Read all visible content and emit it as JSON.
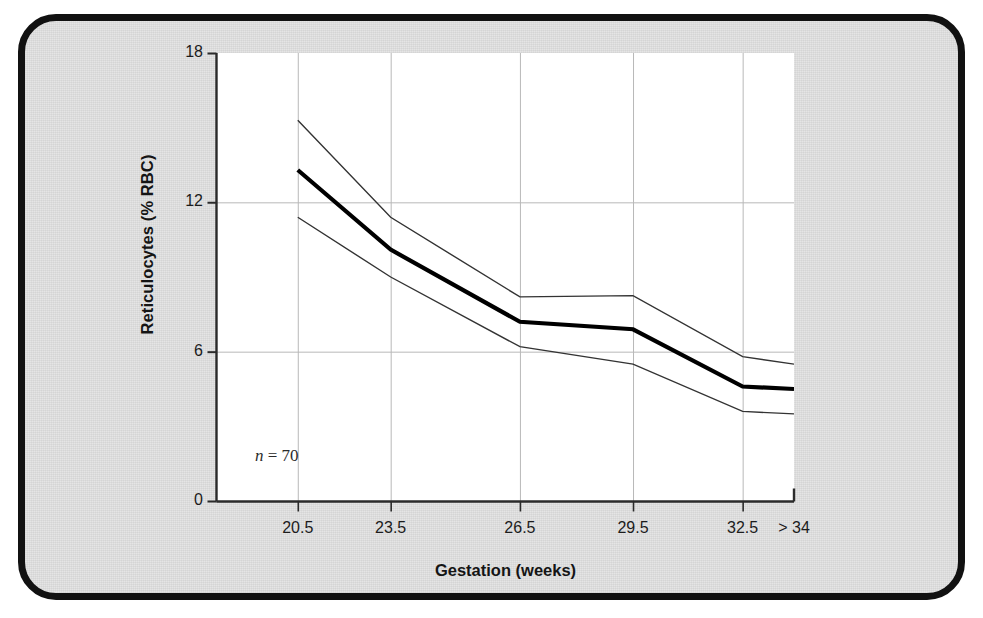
{
  "figure": {
    "background_color": "#e3e3e3",
    "border_color": "#111111",
    "plot_background_color": "#ffffff"
  },
  "chart_data": {
    "type": "line",
    "title": "",
    "subtitle": "",
    "xlabel": "Gestation (weeks)",
    "ylabel": "Reticulocytes (% RBC)",
    "categories": [
      "20.5",
      "23.5",
      "26.5",
      "29.5",
      "32.5",
      "> 34"
    ],
    "x_tick_labels": [
      "20.5",
      "23.5",
      "26.5",
      "29.5",
      "32.5",
      "> 34"
    ],
    "y_tick_labels": [
      "0",
      "6",
      "12",
      "18"
    ],
    "y_ticks": [
      0,
      6,
      12,
      18
    ],
    "ylim": [
      0,
      18
    ],
    "grid": "both",
    "legend": "none",
    "annotations": [
      {
        "text": "n = 70",
        "symbol": "n",
        "value": "= 70"
      }
    ],
    "series": [
      {
        "name": "Upper limit",
        "style": "thin",
        "color": "#333333",
        "values": [
          15.3,
          11.4,
          8.2,
          8.25,
          5.8,
          5.5
        ]
      },
      {
        "name": "Mean",
        "style": "thick",
        "color": "#000000",
        "values": [
          13.3,
          10.1,
          7.2,
          6.9,
          4.6,
          4.5
        ]
      },
      {
        "name": "Lower limit",
        "style": "thin",
        "color": "#333333",
        "values": [
          11.4,
          9.0,
          6.2,
          5.5,
          3.6,
          3.5
        ]
      }
    ]
  },
  "axis_label_x": "Gestation (weeks)",
  "axis_label_y": "Reticulocytes (% RBC)",
  "annotation_n": "n",
  "annotation_n_value": "= 70"
}
